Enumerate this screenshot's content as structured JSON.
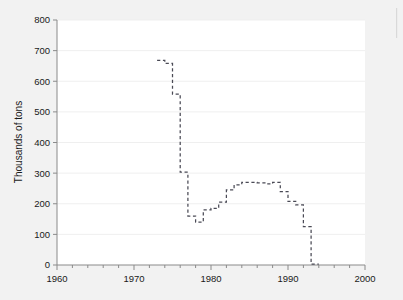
{
  "figure": {
    "background_color": "#f2f2f2",
    "plot_background_color": "#ffffff",
    "axis_color": "#8a8a8a",
    "grid_color": "#efefef",
    "series_color": "#4a4a55"
  },
  "chart_data": {
    "type": "line",
    "line_style": "dashed",
    "drawstyle": "steps-post",
    "title": "",
    "subtitle": "",
    "xlabel": "",
    "ylabel": "Thousands of tons",
    "xlim": [
      1960,
      2000
    ],
    "ylim": [
      0,
      800
    ],
    "xticks": [
      1960,
      1970,
      1980,
      1990,
      2000
    ],
    "xtick_labels": [
      "1960",
      "1970",
      "1980",
      "1990",
      "2000"
    ],
    "x_minor_tick_interval": 2,
    "yticks": [
      0,
      100,
      200,
      300,
      400,
      500,
      600,
      700,
      800
    ],
    "ytick_labels": [
      "0",
      "100",
      "200",
      "300",
      "400",
      "500",
      "600",
      "700",
      "800"
    ],
    "grid": "horizontal",
    "legend": "none",
    "annotations": [],
    "x": [
      1973,
      1974,
      1975,
      1976,
      1977,
      1978,
      1979,
      1980,
      1981,
      1982,
      1983,
      1984,
      1985,
      1986,
      1987,
      1988,
      1989,
      1990,
      1991,
      1992,
      1993,
      1994
    ],
    "values": [
      668,
      658,
      558,
      303,
      160,
      140,
      180,
      185,
      205,
      245,
      262,
      270,
      270,
      268,
      265,
      270,
      240,
      208,
      196,
      125,
      3,
      3
    ],
    "series": [
      {
        "name": "Thousands of tons",
        "values": [
          668,
          658,
          558,
          303,
          160,
          140,
          180,
          185,
          205,
          245,
          262,
          270,
          270,
          268,
          265,
          270,
          240,
          208,
          196,
          125,
          3,
          3
        ]
      }
    ]
  }
}
